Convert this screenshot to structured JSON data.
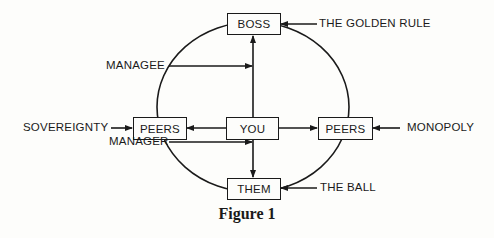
{
  "diagram": {
    "nodes": {
      "boss": "BOSS",
      "you": "YOU",
      "peers_left": "PEERS",
      "peers_right": "PEERS",
      "them": "THEM"
    },
    "labels": {
      "golden_rule": "THE GOLDEN RULE",
      "managee": "MANAGEE",
      "sovereignty": "SOVEREIGNTY",
      "monopoly": "MONOPOLY",
      "manager": "MANAGER",
      "the_ball": "THE BALL"
    },
    "caption": "Figure 1",
    "colors": {
      "ink": "#1a1a1a",
      "paper": "#fdfdfb"
    }
  }
}
